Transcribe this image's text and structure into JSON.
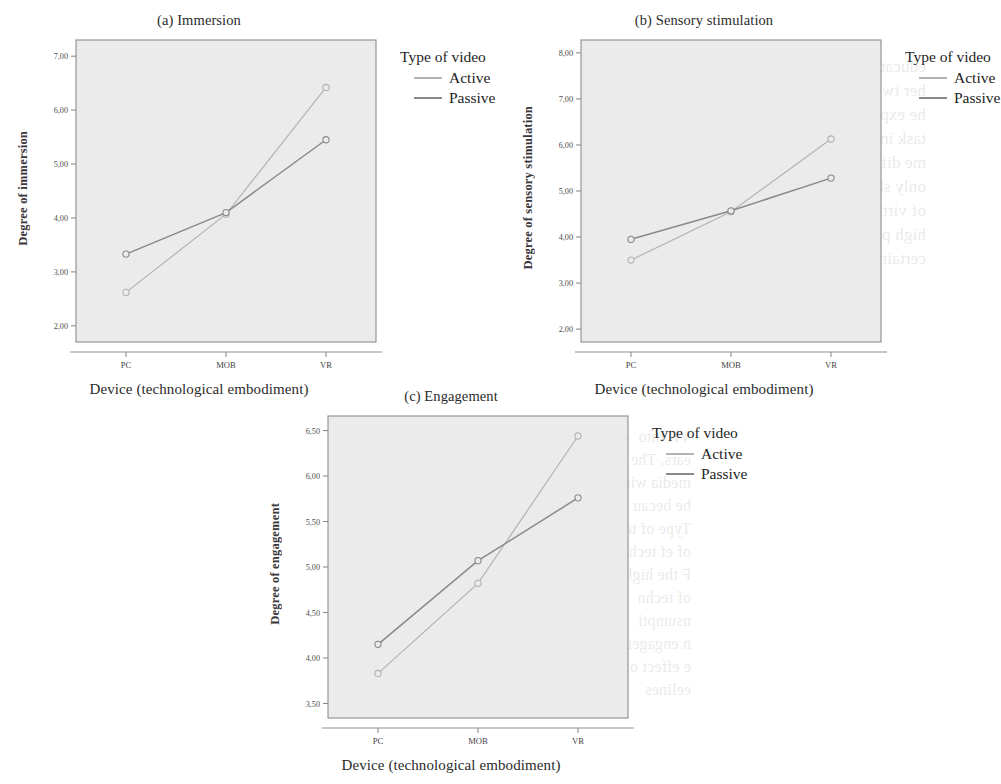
{
  "page": {
    "background_color": "#ffffff",
    "plot_area_color": "#ebebeb",
    "axis_color": "#8d8d8d",
    "ghost_text_left": "e position of CTS found it\nstronger impact on behaviors\nheoretical approach in the\nnology. Likewise, the results\nsuggest we re the case of activ\nsion on sensory stimulation\nthe explanatory power of the VR\nthan might sensory stimulation\nconsumer interest in the devi",
    "ghost_text_right": "educational technology\nher two potential media\nhe experiment compare with\ntask in order to understand\nme difference. Why the\nonly short and simple tasks\nof virtual sense for students\nhigh potential of interactivity\ncertain effects",
    "ghost_text_mid": "VR into  a\nears. The curr\nmedia with\nbe becau\nType of tech\nof ef techno\nF the high\nof techn\nnsumpti\nn engagement\ne effect of the\neelines"
  },
  "legend": {
    "title": "Type of video",
    "series": [
      {
        "label": "Active",
        "color": "#b3b3b3"
      },
      {
        "label": "Passive",
        "color": "#8a8a8a"
      }
    ]
  },
  "common": {
    "xlabel": "Device (technological embodiment)",
    "categories": [
      "PC",
      "MOB",
      "VR"
    ]
  },
  "chart_data": [
    {
      "id": "immersion",
      "type": "line",
      "title": "(a) Immersion",
      "xlabel": "Device (technological embodiment)",
      "ylabel": "Degree of immersion",
      "categories": [
        "PC",
        "MOB",
        "VR"
      ],
      "ylim": [
        1.7,
        7.3
      ],
      "yticks": [
        2.0,
        3.0,
        4.0,
        5.0,
        6.0,
        7.0
      ],
      "ytick_labels": [
        "2,00",
        "3,00",
        "4,00",
        "5,00",
        "6,00",
        "7,00"
      ],
      "grid": false,
      "legend_position": "right",
      "series": [
        {
          "name": "Active",
          "color": "#b3b3b3",
          "values": [
            2.62,
            4.07,
            6.42
          ]
        },
        {
          "name": "Passive",
          "color": "#8a8a8a",
          "values": [
            3.33,
            4.1,
            5.45
          ]
        }
      ]
    },
    {
      "id": "sensory-stimulation",
      "type": "line",
      "title": "(b) Sensory stimulation",
      "xlabel": "Device (technological embodiment)",
      "ylabel": "Degree of sensory stimulation",
      "categories": [
        "PC",
        "MOB",
        "VR"
      ],
      "ylim": [
        1.72,
        8.28
      ],
      "yticks": [
        2.0,
        3.0,
        4.0,
        5.0,
        6.0,
        7.0,
        8.0
      ],
      "ytick_labels": [
        "2,00",
        "3,00",
        "4,00",
        "5,00",
        "6,00",
        "7,00",
        "8,00"
      ],
      "grid": false,
      "legend_position": "right",
      "series": [
        {
          "name": "Active",
          "color": "#b3b3b3",
          "values": [
            3.5,
            4.55,
            6.13
          ]
        },
        {
          "name": "Passive",
          "color": "#8a8a8a",
          "values": [
            3.95,
            4.57,
            5.28
          ]
        }
      ]
    },
    {
      "id": "engagement",
      "type": "line",
      "title": "(c) Engagement",
      "xlabel": "Device (technological embodiment)",
      "ylabel": "Degree of engagement",
      "categories": [
        "PC",
        "MOB",
        "VR"
      ],
      "ylim": [
        3.34,
        6.66
      ],
      "yticks": [
        3.5,
        4.0,
        4.5,
        5.0,
        5.5,
        6.0,
        6.5
      ],
      "ytick_labels": [
        "3,50",
        "4,00",
        "4,50",
        "5,00",
        "5,50",
        "6,00",
        "6,50"
      ],
      "grid": false,
      "legend_position": "right",
      "series": [
        {
          "name": "Active",
          "color": "#b3b3b3",
          "values": [
            3.83,
            4.82,
            6.44
          ]
        },
        {
          "name": "Passive",
          "color": "#8a8a8a",
          "values": [
            4.15,
            5.07,
            5.76
          ]
        }
      ]
    }
  ]
}
